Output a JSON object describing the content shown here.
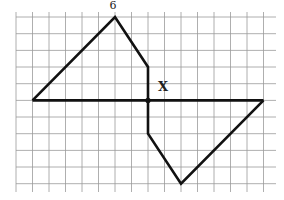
{
  "figure": {
    "top_label": "6",
    "point_label": "X",
    "grid": {
      "x_lines": [
        16,
        32.5,
        49,
        65.5,
        82,
        98.5,
        115,
        131.5,
        148,
        164.5,
        181,
        197.5,
        214,
        230.5,
        247,
        263.5
      ],
      "y_lines": [
        17,
        33.7,
        50.4,
        67,
        83.7,
        100.4,
        117,
        133.7,
        150.4,
        167,
        183.7
      ],
      "x_extent": [
        16,
        276
      ],
      "y_extent": [
        12,
        192
      ],
      "color": "#9a9a9a"
    },
    "shape": {
      "stroke": "#111111",
      "polyline_upper": [
        [
          32.5,
          100.4
        ],
        [
          115,
          17
        ],
        [
          148,
          67
        ],
        [
          148,
          100.4
        ]
      ],
      "polyline_lower": [
        [
          148,
          100.4
        ],
        [
          148,
          133.7
        ],
        [
          181,
          183.7
        ],
        [
          263.5,
          100.4
        ]
      ],
      "axis_line": [
        [
          32.5,
          100.4
        ],
        [
          263.5,
          100.4
        ]
      ],
      "center_point": [
        148,
        100.4
      ]
    }
  }
}
